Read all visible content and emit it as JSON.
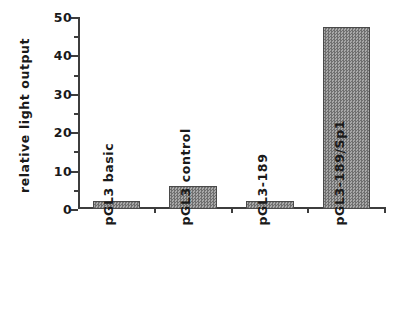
{
  "chart_data": {
    "type": "bar",
    "title": "",
    "xlabel": "",
    "ylabel": "relative light output",
    "categories": [
      "pGL3 basic",
      "pGL3 control",
      "pGL3-189",
      "pGL3-189/Sp1"
    ],
    "values": [
      2.0,
      6.0,
      2.2,
      47.5
    ],
    "ylim": [
      0,
      50
    ],
    "y_ticks_major": [
      0,
      10,
      20,
      30,
      40,
      50
    ],
    "y_tick_labels": [
      "0",
      "10",
      "20",
      "30",
      "40",
      "50"
    ],
    "y_ticks_minor": [
      5,
      15,
      25,
      35,
      45
    ],
    "grid": false,
    "legend": null,
    "bar_color": "#8e8e8e",
    "bar_edge_color": "#4a4a4a",
    "axis_color": "#3d3d3d",
    "background_color": "#ffffff"
  }
}
